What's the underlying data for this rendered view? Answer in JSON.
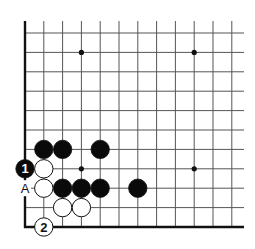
{
  "diagram": {
    "type": "go-board-fragment",
    "grid": {
      "columns": 12,
      "rows": 11,
      "origin_x": 25,
      "origin_y": 33,
      "spacing_x": 18.8,
      "spacing_y": 19.4,
      "right_extent_x": 244,
      "edges": [
        "left",
        "bottom"
      ],
      "line_color": "#555555",
      "edge_color": "#111111"
    },
    "star_points": [
      {
        "col": 3,
        "row": 1
      },
      {
        "col": 9,
        "row": 1
      },
      {
        "col": 3,
        "row": 7
      },
      {
        "col": 9,
        "row": 7
      }
    ],
    "stones": [
      {
        "color": "black",
        "col": 1,
        "row": 6,
        "label": ""
      },
      {
        "color": "black",
        "col": 2,
        "row": 6,
        "label": ""
      },
      {
        "color": "black",
        "col": 4,
        "row": 6,
        "label": ""
      },
      {
        "color": "black",
        "col": 0,
        "row": 7,
        "label": "1"
      },
      {
        "color": "white",
        "col": 1,
        "row": 7,
        "label": ""
      },
      {
        "color": "white",
        "col": 1,
        "row": 8,
        "label": ""
      },
      {
        "color": "black",
        "col": 2,
        "row": 8,
        "label": ""
      },
      {
        "color": "black",
        "col": 3,
        "row": 8,
        "label": ""
      },
      {
        "color": "black",
        "col": 4,
        "row": 8,
        "label": ""
      },
      {
        "color": "black",
        "col": 6,
        "row": 8,
        "label": ""
      },
      {
        "color": "white",
        "col": 2,
        "row": 9,
        "label": ""
      },
      {
        "color": "white",
        "col": 3,
        "row": 9,
        "label": ""
      },
      {
        "color": "white",
        "col": 1,
        "row": 10,
        "label": "2"
      }
    ],
    "point_labels": [
      {
        "col": 0,
        "row": 8,
        "text": "A"
      }
    ],
    "colors": {
      "black_stone": "#0a0a0a",
      "white_stone": "#ffffff",
      "stone_outline": "#111111",
      "background": "#ffffff"
    }
  }
}
